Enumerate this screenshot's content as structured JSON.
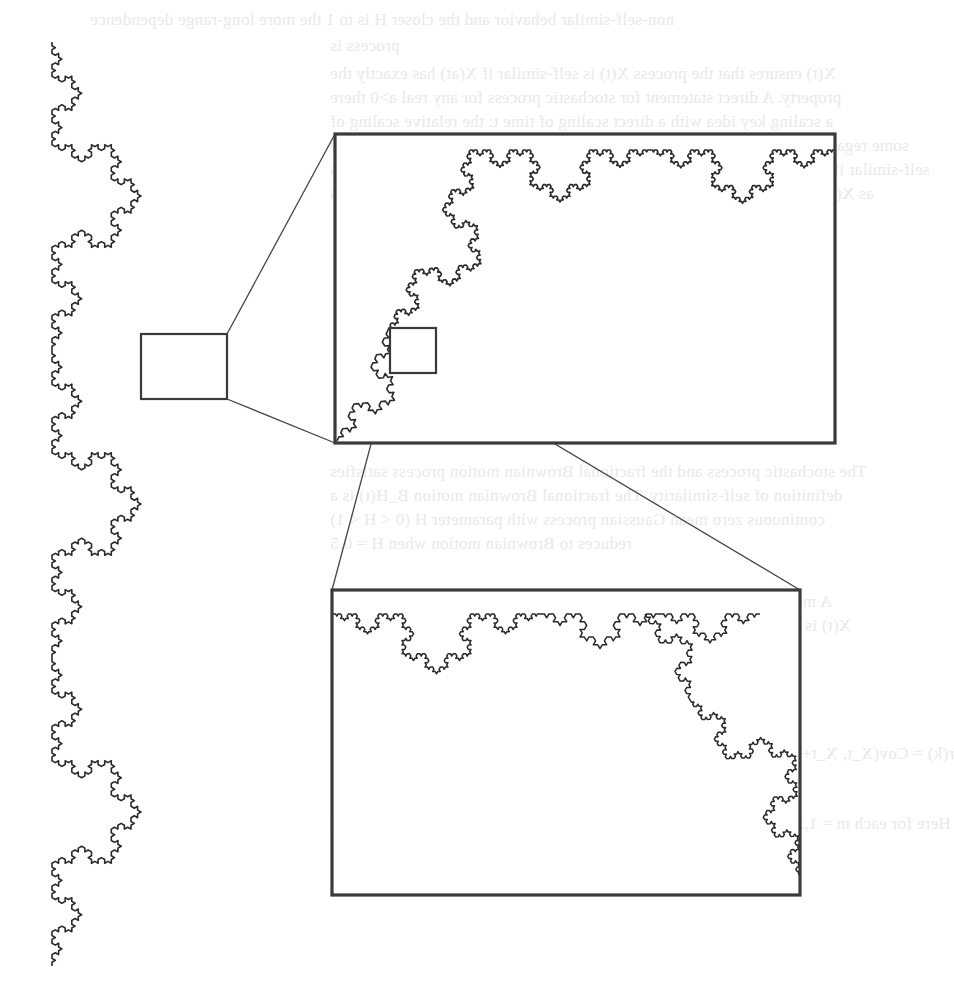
{
  "figure": {
    "stroke_color": "#2a2a2a",
    "box_color": "#3a3a3a",
    "connector_color": "#444444",
    "background": "#ffffff",
    "main_curve": {
      "label": "Koch curve (full)",
      "segments": [
        {
          "x1": 52,
          "y1": 42,
          "x2": 52,
          "y2": 350,
          "bulge": "right"
        },
        {
          "x1": 52,
          "y1": 350,
          "x2": 52,
          "y2": 658,
          "bulge": "right"
        },
        {
          "x1": 52,
          "y1": 658,
          "x2": 52,
          "y2": 966,
          "bulge": "right"
        }
      ],
      "order": 4
    },
    "zoom_level_1": {
      "label": "small selection box",
      "box": {
        "x": 141,
        "y": 334,
        "w": 86,
        "h": 65
      }
    },
    "inset_1": {
      "label": "magnified view level 1",
      "box": {
        "x": 335,
        "y": 134,
        "w": 500,
        "h": 309
      },
      "curve": [
        {
          "x1": 335,
          "y1": 441,
          "x2": 470,
          "y2": 150,
          "order": 4,
          "bulge": "left"
        },
        {
          "x1": 470,
          "y1": 150,
          "x2": 835,
          "y2": 150,
          "order": 4,
          "bulge": "down_up"
        }
      ],
      "zoom_box": {
        "x": 390,
        "y": 328,
        "w": 46,
        "h": 45
      }
    },
    "inset_2": {
      "label": "magnified view level 2",
      "box": {
        "x": 332,
        "y": 590,
        "w": 468,
        "h": 305
      },
      "curve": [
        {
          "x1": 333,
          "y1": 614,
          "x2": 800,
          "y2": 876,
          "order": 5
        }
      ]
    },
    "connectors": [
      {
        "from": "zoom_level_1.top_right",
        "to": "inset_1.top_left",
        "x1": 227,
        "y1": 334,
        "x2": 335,
        "y2": 134
      },
      {
        "from": "zoom_level_1.bottom_right",
        "to": "inset_1.bottom_left",
        "x1": 227,
        "y1": 399,
        "x2": 335,
        "y2": 443
      },
      {
        "from": "inset_1.zoom_box.bottom_left",
        "to": "inset_2.top_left",
        "x1": 390,
        "y1": 373,
        "x2": 332,
        "y2": 590
      },
      {
        "from": "inset_1.zoom_box.bottom_right",
        "to": "inset_2.top_right",
        "x1": 436,
        "y1": 373,
        "x2": 800,
        "y2": 590
      }
    ]
  },
  "bleed_through": {
    "note": "faint mirrored text from reverse page",
    "lines": [
      {
        "y": 18,
        "x": 90,
        "text": "non-self-similar behavior and the closer H is to 1 the more long-range dependence"
      },
      {
        "y": 44,
        "x": 330,
        "text": "process is"
      },
      {
        "y": 72,
        "x": 330,
        "text": "X(t) ensures that the process X(t) is self-similar if X(at) has exactly the"
      },
      {
        "y": 96,
        "x": 330,
        "text": "property. A direct statement for stochastic process for any real a>0 there"
      },
      {
        "y": 120,
        "x": 330,
        "text": "a scaling key idea with a direct scaling of time t: the relative scaling of"
      },
      {
        "y": 144,
        "x": 330,
        "text": "some regardless of what scale we choose. A stochastic process X(t) is statistically"
      },
      {
        "y": 168,
        "x": 330,
        "text": "self-similar if for any a > 0 the process a^-H X(at) has the same statistical properties"
      },
      {
        "y": 192,
        "x": 330,
        "text": "as X(t). The relationship may be expressed by the following three conditions"
      },
      {
        "y": 262,
        "x": 500,
        "text": "E[X(t)] = E[X(at)] / a^H   mean"
      },
      {
        "y": 326,
        "x": 480,
        "text": "Var[X(t)] = Var[X(at)] / a^2H   variance"
      },
      {
        "y": 400,
        "x": 480,
        "text": "R_x(t,s) = R_x(at,as) / a^2H   correlation"
      },
      {
        "y": 470,
        "x": 330,
        "text": "The stochastic process and the fractional Brownian motion process satisfies"
      },
      {
        "y": 494,
        "x": 330,
        "text": "definition of self-similarity. The fractional Brownian motion B_H(t) is a"
      },
      {
        "y": 518,
        "x": 330,
        "text": "continuous zero mean Gaussian process with parameter H (0 < H < 1)"
      },
      {
        "y": 542,
        "x": 330,
        "text": "reduces to Brownian motion when H = 0.5"
      },
      {
        "y": 600,
        "x": 330,
        "text": "A more restrictive definition of self-similarity may be given as follows"
      },
      {
        "y": 624,
        "x": 330,
        "text": "X(t) is said to be exactly second-order (also called wide-sense) stationary"
      },
      {
        "y": 648,
        "x": 330,
        "text": "positive stochastic process with a constant mean mu = E[X(t)],"
      },
      {
        "y": 672,
        "x": 330,
        "text": "variance sigma^2 = E[(X(t)-mu)^2] and autocorrelation function"
      },
      {
        "y": 752,
        "x": 330,
        "text": "r(k) = Cov(X_t, X_t+k) / Var(X_t) = E[(X_t - mu)(X_t+k - mu)] / sigma^2 ,  k = 0,1,2,..."
      },
      {
        "y": 822,
        "x": 330,
        "text": "Here for each m = 1,2,... k new aggregated time series X^(m) = (X_k^(m): k = 1,2,3,...)"
      }
    ]
  }
}
